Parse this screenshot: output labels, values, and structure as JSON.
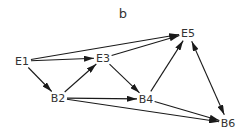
{
  "title": "b",
  "colors": {
    "edge": "#1a1a1a",
    "text": "#333333",
    "background": "#ffffff"
  },
  "nodes": [
    {
      "id": "E1",
      "label": "E1",
      "x": 22,
      "y": 61
    },
    {
      "id": "E3",
      "label": "E3",
      "x": 103,
      "y": 58
    },
    {
      "id": "E5",
      "label": "E5",
      "x": 188,
      "y": 33
    },
    {
      "id": "B2",
      "label": "B2",
      "x": 58,
      "y": 98
    },
    {
      "id": "B4",
      "label": "B4",
      "x": 146,
      "y": 99
    },
    {
      "id": "B6",
      "label": "B6",
      "x": 228,
      "y": 123
    }
  ],
  "edges": [
    {
      "from": "E1",
      "to": "E5",
      "bidirectional": false
    },
    {
      "from": "E1",
      "to": "E3",
      "bidirectional": false
    },
    {
      "from": "E1",
      "to": "B2",
      "bidirectional": false
    },
    {
      "from": "B2",
      "to": "E3",
      "bidirectional": false
    },
    {
      "from": "E3",
      "to": "E5",
      "bidirectional": false
    },
    {
      "from": "E3",
      "to": "B4",
      "bidirectional": false
    },
    {
      "from": "B2",
      "to": "B4",
      "bidirectional": false
    },
    {
      "from": "B2",
      "to": "B6",
      "bidirectional": false
    },
    {
      "from": "B4",
      "to": "E5",
      "bidirectional": false
    },
    {
      "from": "B4",
      "to": "B6",
      "bidirectional": false
    },
    {
      "from": "E5",
      "to": "B6",
      "bidirectional": true
    }
  ]
}
